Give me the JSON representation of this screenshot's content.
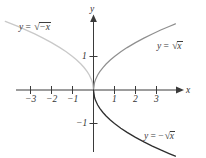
{
  "figure": {
    "background_color": "#ffffff",
    "width": 206,
    "height": 158
  },
  "axes": {
    "x_label": "x",
    "y_label": "y",
    "origin_px": {
      "x": 93,
      "y": 90
    },
    "unit_px": {
      "x": 21,
      "y": 33.5
    },
    "axis_color": "#3a3a3a",
    "x_ticks": [
      {
        "value": -3,
        "label": "−3"
      },
      {
        "value": -2,
        "label": "−2"
      },
      {
        "value": -1,
        "label": "−1"
      },
      {
        "value": 1,
        "label": "1"
      },
      {
        "value": 2,
        "label": "2"
      },
      {
        "value": 3,
        "label": "3"
      }
    ],
    "y_ticks": [
      {
        "value": 1,
        "label": "1"
      },
      {
        "value": -1,
        "label": "−1"
      }
    ]
  },
  "curve_labels": {
    "left": {
      "lhs": "y",
      "eq": "=",
      "radicand": "−x",
      "sign": ""
    },
    "upper_right": {
      "lhs": "y",
      "eq": "=",
      "radicand": "x",
      "sign": ""
    },
    "lower_right": {
      "lhs": "y",
      "eq": "=",
      "radicand": "x",
      "sign": "−"
    }
  },
  "chart_data": {
    "type": "line",
    "title": "",
    "xlabel": "x",
    "ylabel": "y",
    "xlim": [
      -3.9,
      3.9
    ],
    "ylim": [
      -2.05,
      2.05
    ],
    "grid": false,
    "legend": "inline-annotations",
    "xticks": [
      -3,
      -2,
      -1,
      1,
      2,
      3
    ],
    "yticks": [
      -1,
      1
    ],
    "series": [
      {
        "name": "y = √x",
        "color": "#8f8f8f",
        "linewidth": 1.2,
        "annotation": "y = √x",
        "annotation_xy": [
          2.45,
          1.35
        ],
        "x": [
          0,
          0.05,
          0.1,
          0.2,
          0.3,
          0.45,
          0.6,
          0.8,
          1.0,
          1.3,
          1.6,
          2.0,
          2.4,
          2.8,
          3.2,
          3.6,
          3.9
        ],
        "y": [
          0,
          0.224,
          0.316,
          0.447,
          0.548,
          0.671,
          0.775,
          0.894,
          1.0,
          1.14,
          1.265,
          1.414,
          1.549,
          1.673,
          1.789,
          1.897,
          1.975
        ]
      },
      {
        "name": "y = −√x",
        "color": "#2e2e2e",
        "linewidth": 1.3,
        "annotation": "y = −√x",
        "annotation_xy": [
          2.45,
          -1.52
        ],
        "x": [
          0,
          0.05,
          0.1,
          0.2,
          0.3,
          0.45,
          0.6,
          0.8,
          1.0,
          1.3,
          1.6,
          2.0,
          2.4,
          2.8,
          3.2,
          3.6,
          3.9
        ],
        "y": [
          0,
          -0.224,
          -0.316,
          -0.447,
          -0.548,
          -0.671,
          -0.775,
          -0.894,
          -1.0,
          -1.14,
          -1.265,
          -1.414,
          -1.549,
          -1.673,
          -1.789,
          -1.897,
          -1.975
        ]
      },
      {
        "name": "y = √−x",
        "color": "#c9c9c9",
        "linewidth": 1.3,
        "annotation": "y = √−x",
        "annotation_xy": [
          -2.85,
          1.72
        ],
        "x": [
          0,
          -0.05,
          -0.1,
          -0.2,
          -0.3,
          -0.45,
          -0.6,
          -0.8,
          -1.0,
          -1.3,
          -1.6,
          -2.0,
          -2.4,
          -2.8,
          -3.2,
          -3.6,
          -4.2
        ],
        "y": [
          0,
          0.224,
          0.316,
          0.447,
          0.548,
          0.671,
          0.775,
          0.894,
          1.0,
          1.14,
          1.265,
          1.414,
          1.549,
          1.673,
          1.789,
          1.897,
          2.05
        ]
      }
    ]
  }
}
